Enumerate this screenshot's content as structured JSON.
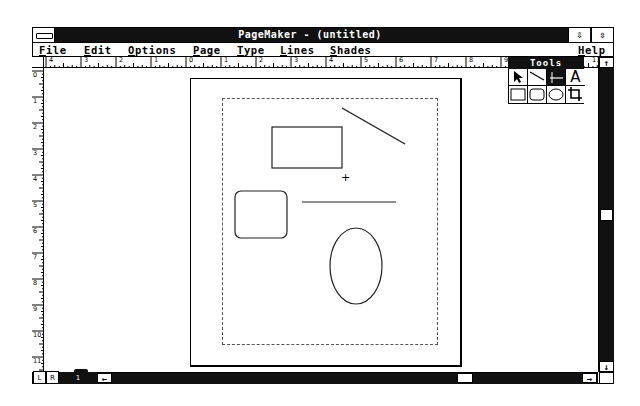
{
  "window": {
    "title": "PageMaker - (untitled)",
    "minimize_glyph": "⇩",
    "maximize_glyph": "⇳"
  },
  "menubar": {
    "items": [
      {
        "label": "File",
        "mnemonic": "F"
      },
      {
        "label": "Edit",
        "mnemonic": "E"
      },
      {
        "label": "Options",
        "mnemonic": "O"
      },
      {
        "label": "Page",
        "mnemonic": "P"
      },
      {
        "label": "Type",
        "mnemonic": "T"
      },
      {
        "label": "Lines",
        "mnemonic": "L"
      },
      {
        "label": "Shades",
        "mnemonic": "S"
      },
      {
        "label": "Help",
        "mnemonic": "H"
      }
    ]
  },
  "rulers": {
    "horizontal": [
      "4",
      "3",
      "2",
      "1",
      "0",
      "1",
      "2",
      "3",
      "4",
      "5",
      "6",
      "7",
      "8",
      "9",
      "10",
      "11"
    ],
    "vertical": [
      "0",
      "1",
      "2",
      "3",
      "4",
      "5",
      "6",
      "7",
      "8",
      "9",
      "10",
      "11"
    ]
  },
  "tools": {
    "title": "Tools",
    "items": [
      {
        "name": "pointer",
        "glyph": "↖"
      },
      {
        "name": "diagonal-line",
        "glyph": "╲"
      },
      {
        "name": "perpendicular-line",
        "glyph": "┼",
        "selected": true
      },
      {
        "name": "text",
        "glyph": "A"
      },
      {
        "name": "square-corner-rectangle",
        "glyph": "□"
      },
      {
        "name": "rounded-rectangle",
        "glyph": "▢"
      },
      {
        "name": "oval",
        "glyph": "○"
      },
      {
        "name": "crop",
        "glyph": "⌗"
      }
    ]
  },
  "pages": {
    "left_master": "L",
    "right_master": "R",
    "page_number": "1"
  },
  "scroll": {
    "up": "↑",
    "down": "↓",
    "left": "←",
    "right": "→"
  },
  "canvas": {
    "crosshair": "+"
  },
  "colors": {
    "bar": "#111111",
    "paper": "#ffffff",
    "ink": "#000000",
    "margin_guide": "#555555"
  }
}
